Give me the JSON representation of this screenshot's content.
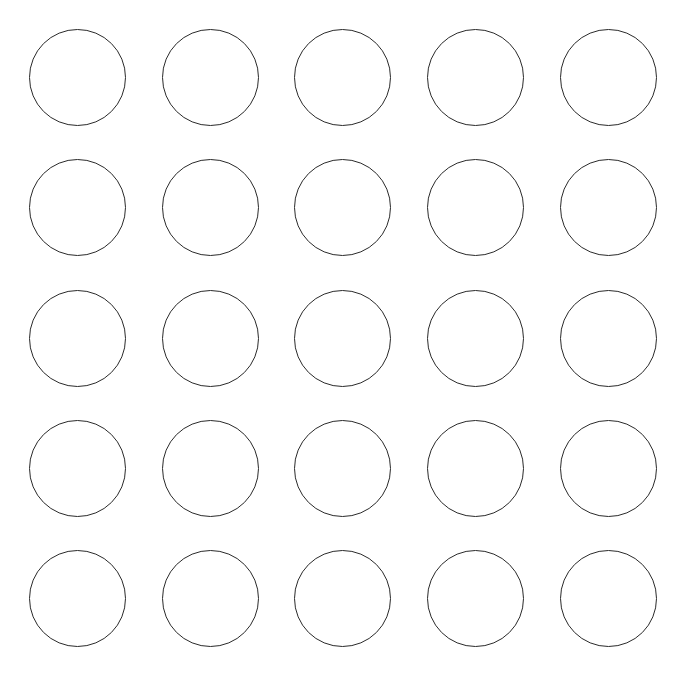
{
  "diagram": {
    "type": "circle-grid",
    "rows": 5,
    "columns": 5,
    "background_color": "#ffffff",
    "stroke_color": "#2a2a2a",
    "stroke_width": 1.6,
    "circle_diameter": 97,
    "column_centers_x": [
      77,
      210,
      342,
      475,
      608
    ],
    "row_centers_y": [
      77,
      207,
      338,
      468,
      598
    ],
    "circles": [
      {
        "row": 1,
        "col": 1
      },
      {
        "row": 1,
        "col": 2
      },
      {
        "row": 1,
        "col": 3
      },
      {
        "row": 1,
        "col": 4
      },
      {
        "row": 1,
        "col": 5
      },
      {
        "row": 2,
        "col": 1
      },
      {
        "row": 2,
        "col": 2
      },
      {
        "row": 2,
        "col": 3
      },
      {
        "row": 2,
        "col": 4
      },
      {
        "row": 2,
        "col": 5
      },
      {
        "row": 3,
        "col": 1
      },
      {
        "row": 3,
        "col": 2
      },
      {
        "row": 3,
        "col": 3
      },
      {
        "row": 3,
        "col": 4
      },
      {
        "row": 3,
        "col": 5
      },
      {
        "row": 4,
        "col": 1
      },
      {
        "row": 4,
        "col": 2
      },
      {
        "row": 4,
        "col": 3
      },
      {
        "row": 4,
        "col": 4
      },
      {
        "row": 4,
        "col": 5
      },
      {
        "row": 5,
        "col": 1
      },
      {
        "row": 5,
        "col": 2
      },
      {
        "row": 5,
        "col": 3
      },
      {
        "row": 5,
        "col": 4
      },
      {
        "row": 5,
        "col": 5
      }
    ]
  }
}
